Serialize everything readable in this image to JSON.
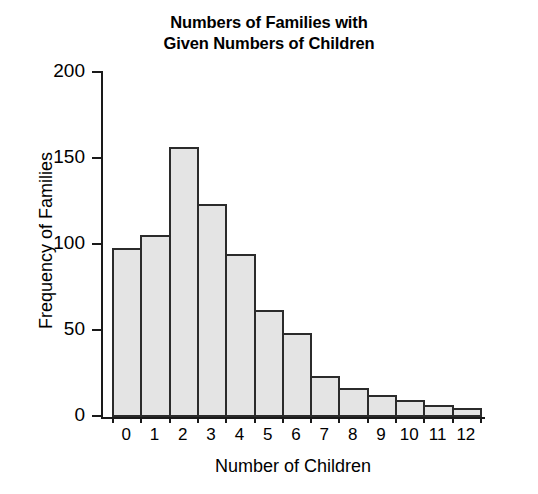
{
  "chart_data": {
    "type": "bar",
    "title": "Numbers of Families with Given Numbers of Children",
    "title_lines": [
      "Numbers of Families with",
      "Given Numbers of Children"
    ],
    "xlabel": "Number of Children",
    "ylabel": "Frequency of Families",
    "categories": [
      "0",
      "1",
      "2",
      "3",
      "4",
      "5",
      "6",
      "7",
      "8",
      "9",
      "10",
      "11",
      "12"
    ],
    "values": [
      98,
      106,
      157,
      124,
      95,
      62,
      49,
      24,
      17,
      13,
      10,
      7,
      5
    ],
    "ylim": [
      0,
      200
    ],
    "yticks": [
      "0",
      "50",
      "100",
      "150",
      "200"
    ],
    "ytick_values": [
      0,
      50,
      100,
      150,
      200
    ],
    "grid": false,
    "legend": false,
    "bar_fill_color": "#e4e4e4",
    "bar_edge_color": "#2b2b2b",
    "axis_color": "#1a1a1a",
    "background_color": "#ffffff"
  }
}
